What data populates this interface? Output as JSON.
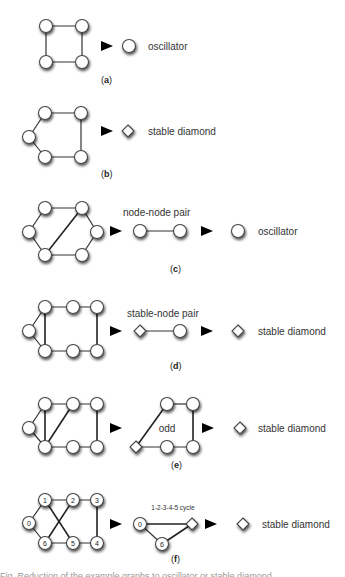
{
  "figure": {
    "panels": [
      {
        "id": "a",
        "label": "a",
        "result_label": "oscillator",
        "result_type": "node"
      },
      {
        "id": "b",
        "label": "b",
        "result_label": "stable diamond",
        "result_type": "diamond"
      },
      {
        "id": "c",
        "label": "c",
        "intermediate_label": "node-node pair",
        "result_label": "oscillator",
        "result_type": "node"
      },
      {
        "id": "d",
        "label": "d",
        "intermediate_label": "stable-node pair",
        "result_label": "stable diamond",
        "result_type": "diamond"
      },
      {
        "id": "e",
        "label": "e",
        "intermediate_label": "odd",
        "result_label": "stable diamond",
        "result_type": "diamond"
      },
      {
        "id": "f",
        "label": "f",
        "intermediate_label": "1-2-3-4-5 cycle",
        "result_label": "stable diamond",
        "result_type": "diamond",
        "node_numbers": [
          "0",
          "1",
          "2",
          "3",
          "4",
          "5",
          "6"
        ],
        "reduced_node_numbers": [
          "0",
          "6"
        ]
      }
    ],
    "paren_open": "(",
    "paren_close": ")",
    "caption_partial": "Fig. Reduction of the example graphs to oscillator or stable diamond"
  }
}
